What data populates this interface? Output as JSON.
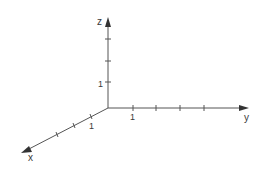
{
  "diagram": {
    "type": "3d-coordinate-axes",
    "axes": {
      "x": {
        "label": "x",
        "unit_label": "1",
        "tick_count": 3
      },
      "y": {
        "label": "y",
        "unit_label": "1",
        "tick_count": 4
      },
      "z": {
        "label": "z",
        "unit_label": "1",
        "tick_count": 3
      }
    },
    "colors": {
      "axis": "#555555",
      "text": "#3a3a3a",
      "background": "#ffffff"
    }
  }
}
